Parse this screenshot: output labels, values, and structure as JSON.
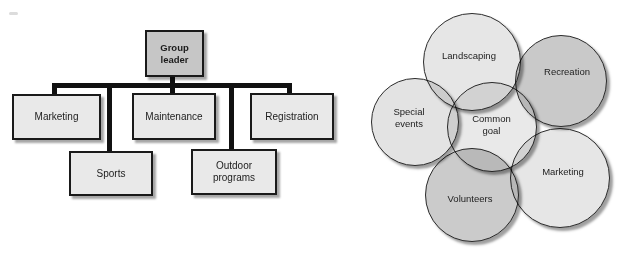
{
  "org_chart": {
    "root": {
      "label": "Group leader"
    },
    "children": [
      {
        "label": "Marketing"
      },
      {
        "label": "Maintenance"
      },
      {
        "label": "Registration"
      },
      {
        "label": "Sports"
      },
      {
        "label": "Outdoor programs"
      }
    ],
    "colors": {
      "root_fill": "#c6c6c6",
      "box_fill": "#e9e9e9",
      "border": "#1a1a1a",
      "line": "#111111"
    }
  },
  "venn_diagram": {
    "circles": [
      {
        "label": "Landscaping",
        "fill": "#e6e6e6"
      },
      {
        "label": "Recreation",
        "fill": "#c9c9c9"
      },
      {
        "label": "Special events",
        "fill": "#e3e3e3"
      },
      {
        "label": "Common goal",
        "fill": "#e9e9e9"
      },
      {
        "label": "Marketing",
        "fill": "#e6e6e6"
      },
      {
        "label": "Volunteers",
        "fill": "#cbcbcb"
      }
    ]
  }
}
